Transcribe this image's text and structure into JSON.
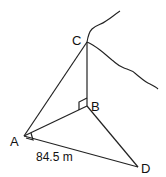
{
  "diagram": {
    "type": "geometry-3d-right-triangles",
    "points": {
      "A": {
        "label": "A",
        "x": 24,
        "y": 136
      },
      "B": {
        "label": "B",
        "x": 87,
        "y": 106
      },
      "C": {
        "label": "C",
        "x": 87,
        "y": 42
      },
      "D": {
        "label": "D",
        "x": 138,
        "y": 167
      }
    },
    "segments": [
      "AC",
      "CB",
      "AB",
      "BD",
      "AD"
    ],
    "right_angles": [
      "ABC",
      "BAD"
    ],
    "measurements": {
      "AD": "84.5 m"
    },
    "labels": {
      "A": "A",
      "B": "B",
      "C": "C",
      "D": "D",
      "AD_length": "84.5 m"
    },
    "cliff_outline": "freehand cliff edge through C"
  }
}
